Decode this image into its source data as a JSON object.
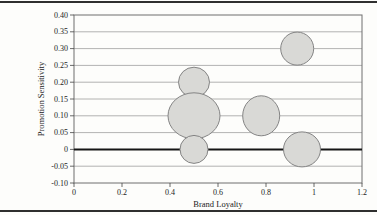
{
  "figure": {
    "background": "#fdfdfb",
    "rule_color": "#2f2f2f"
  },
  "chart_data": {
    "type": "scatter",
    "subtype": "bubble",
    "title": "",
    "xlabel": "Brand Loyalty",
    "ylabel": "Promotion Sensitivity",
    "xlim": [
      0,
      1.2
    ],
    "ylim": [
      -0.1,
      0.4
    ],
    "x_ticks": [
      0,
      0.2,
      0.4,
      0.6,
      0.8,
      1,
      1.2
    ],
    "x_tick_labels": [
      "0",
      "0.2",
      "0.4",
      "0.6",
      "0.8",
      "1",
      "1.2"
    ],
    "y_ticks": [
      0.4,
      0.35,
      0.3,
      0.25,
      0.2,
      0.15,
      0.1,
      0.05,
      0,
      -0.05,
      -0.1
    ],
    "y_tick_labels": [
      "0.40",
      "0.35",
      "0.30",
      "0.25",
      "0.20",
      "0.15",
      "0.10",
      "0.05",
      "0",
      "-0.05",
      "-0.10"
    ],
    "grid": "horizontal-only",
    "zero_line": true,
    "legend": "none",
    "points": [
      {
        "x": 0.5,
        "y": 0.2,
        "rx_px": 15.5,
        "ry_px": 15
      },
      {
        "x": 0.5,
        "y": 0.1,
        "rx_px": 26,
        "ry_px": 23
      },
      {
        "x": 0.5,
        "y": 0.0,
        "rx_px": 14,
        "ry_px": 14
      },
      {
        "x": 0.78,
        "y": 0.1,
        "rx_px": 18.5,
        "ry_px": 20
      },
      {
        "x": 0.93,
        "y": 0.3,
        "rx_px": 16.5,
        "ry_px": 16.5
      },
      {
        "x": 0.95,
        "y": 0.0,
        "rx_px": 18.5,
        "ry_px": 17.5
      }
    ],
    "colors": {
      "bubble_fill": "#d9d9d6",
      "bubble_stroke": "#848484",
      "grid": "#9a9a9a",
      "plot_border": "#6e6e6e",
      "zero_line": "#161616",
      "tick": "#444444",
      "text": "#1c1c1c",
      "background": "#fdfdfb"
    }
  }
}
